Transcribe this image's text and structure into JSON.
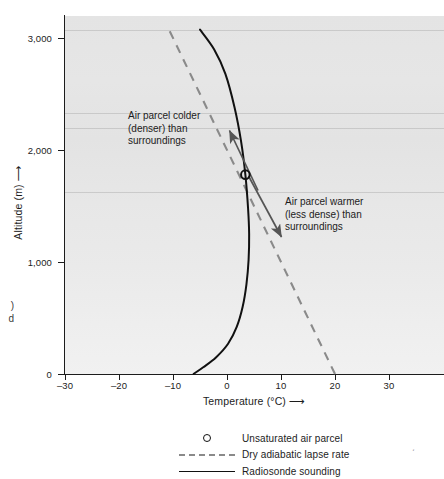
{
  "axes": {
    "x": {
      "label": "Temperature (°C)",
      "arrow": "⟶",
      "ticks": [
        -30,
        -20,
        -10,
        0,
        10,
        20,
        30
      ],
      "tick_labels": [
        "–30",
        "–20",
        "–10",
        "0",
        "10",
        "20",
        "30"
      ],
      "min": -31.0,
      "max": 39.0
    },
    "y": {
      "label": "Altitude (m)",
      "arrow": "⟶",
      "ticks": [
        0,
        1000,
        2000,
        3000
      ],
      "tick_labels": [
        "0",
        "1,000",
        "2,000",
        "3,000"
      ],
      "min": 0,
      "max": 3200
    }
  },
  "annotations": [
    {
      "name": "annotation-colder",
      "lines": [
        "Air parcel colder",
        "(denser) than",
        "surroundings"
      ],
      "arrow_points_to": {
        "temperature": 1.0,
        "altitude": 2180
      }
    },
    {
      "name": "annotation-warmer",
      "lines": [
        "Air parcel warmer",
        "(less dense) than",
        "surroundings"
      ],
      "arrow_points_to": {
        "temperature": 7.0,
        "altitude": 1380
      }
    }
  ],
  "legend": {
    "items": [
      {
        "key": "circle-marker",
        "label": "Unsaturated air parcel"
      },
      {
        "key": "dashed-line",
        "label": "Dry adiabatic lapse rate"
      },
      {
        "key": "solid-line",
        "label": "Radiosonde sounding"
      }
    ]
  },
  "edge_fragment": {
    "lines": [
      ")",
      "d"
    ]
  },
  "colors": {
    "plot_background": "#e6e6e6",
    "axis": "#1c1c1c",
    "sounding_line": "#111111",
    "adiabat_line": "#8a8a8a",
    "annotation_arrow": "#555555",
    "marker_outline": "#111111",
    "text": "#1c1c1c"
  },
  "chart_data": {
    "type": "line",
    "title": "",
    "xlabel": "Temperature (°C)",
    "ylabel": "Altitude (m)",
    "xlim": [
      -31,
      39
    ],
    "ylim": [
      0,
      3200
    ],
    "grid": false,
    "legend_position": "below-plot-center",
    "series": [
      {
        "name": "Radiosonde sounding",
        "style": "solid",
        "color": "#111111",
        "x_is_temperature": true,
        "points": [
          {
            "temperature": -6.2,
            "altitude": 0
          },
          {
            "temperature": -4.4,
            "altitude": 60
          },
          {
            "temperature": -2.0,
            "altitude": 150
          },
          {
            "temperature": 0.2,
            "altitude": 270
          },
          {
            "temperature": 1.8,
            "altitude": 420
          },
          {
            "temperature": 2.9,
            "altitude": 600
          },
          {
            "temperature": 3.6,
            "altitude": 800
          },
          {
            "temperature": 4.0,
            "altitude": 1020
          },
          {
            "temperature": 4.1,
            "altitude": 1250
          },
          {
            "temperature": 3.9,
            "altitude": 1480
          },
          {
            "temperature": 3.4,
            "altitude": 1780
          },
          {
            "temperature": 2.6,
            "altitude": 2080
          },
          {
            "temperature": 1.4,
            "altitude": 2380
          },
          {
            "temperature": -0.3,
            "altitude": 2680
          },
          {
            "temperature": -2.4,
            "altitude": 2900
          },
          {
            "temperature": -5.0,
            "altitude": 3075
          }
        ]
      },
      {
        "name": "Dry adiabatic lapse rate",
        "style": "dashed",
        "color": "#8a8a8a",
        "x_is_temperature": true,
        "points": [
          {
            "temperature": 20.0,
            "altitude": 0
          },
          {
            "temperature": -11.0,
            "altitude": 3100
          }
        ],
        "lapse_rate_c_per_km": 10.0
      }
    ],
    "markers": [
      {
        "name": "Unsaturated air parcel",
        "shape": "open-circle",
        "temperature": 3.4,
        "altitude": 1780
      }
    ]
  }
}
